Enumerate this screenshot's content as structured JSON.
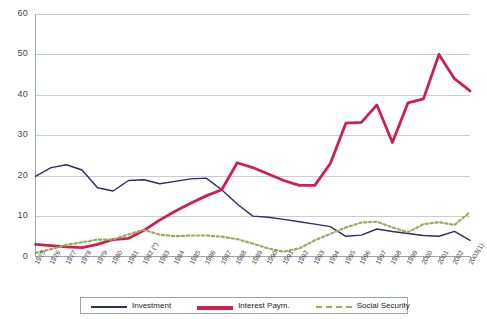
{
  "chart_data": {
    "type": "line",
    "title": "",
    "subtitle": "",
    "xlabel": "",
    "ylabel": "",
    "ylim": [
      0,
      60
    ],
    "yticks": [
      0,
      10,
      20,
      30,
      40,
      50,
      60
    ],
    "grid": true,
    "legend_position": "bottom",
    "categories": [
      "1975",
      "1976",
      "1977",
      "1978",
      "1979",
      "1980",
      "1981",
      "1982 (*)",
      "1983",
      "1984",
      "1985",
      "1986",
      "1987",
      "1988",
      "1989",
      "1990",
      "1991",
      "1992",
      "1993",
      "1994",
      "1995",
      "1996",
      "1997",
      "1998",
      "1999",
      "2000",
      "2001",
      "2002",
      "2003(1)"
    ],
    "series": [
      {
        "name": "Investment",
        "color": "#2b2f63",
        "style": "solid",
        "values": [
          19.8,
          22.0,
          22.7,
          21.4,
          17.0,
          16.2,
          18.8,
          19.0,
          18.0,
          18.6,
          19.2,
          19.4,
          16.5,
          13.0,
          10.0,
          9.7,
          9.2,
          8.6,
          8.0,
          7.4,
          5.0,
          5.3,
          6.8,
          6.2,
          5.7,
          5.2,
          5.0,
          6.2,
          4.0
        ]
      },
      {
        "name": "Interest Paym.",
        "color": "#cf1f4e",
        "style": "solid",
        "values": [
          3.0,
          2.7,
          2.4,
          2.2,
          3.0,
          4.2,
          4.5,
          6.5,
          9.0,
          11.2,
          13.2,
          15.0,
          16.5,
          23.2,
          22.0,
          20.4,
          18.8,
          17.6,
          17.6,
          23.0,
          33.0,
          33.2,
          37.5,
          28.2,
          38.0,
          39.0,
          50.0,
          44.0,
          41.0
        ]
      },
      {
        "name": "Social Security",
        "color": "#9aa860",
        "style": "dashed",
        "values": [
          0.9,
          1.8,
          2.9,
          3.5,
          4.2,
          4.2,
          5.5,
          6.6,
          5.4,
          5.0,
          5.2,
          5.2,
          4.9,
          4.3,
          3.2,
          2.0,
          1.2,
          2.0,
          4.0,
          5.6,
          7.2,
          8.4,
          8.6,
          7.2,
          6.0,
          8.0,
          8.5,
          7.8,
          11.0
        ]
      }
    ]
  },
  "legend": {
    "entries": [
      {
        "label": "Investment",
        "color": "#2b2f63",
        "style": "solid"
      },
      {
        "label": "Interest Paym.",
        "color": "#cf1f4e",
        "style": "solid"
      },
      {
        "label": "Social Security",
        "color": "#9aa860",
        "style": "dashed"
      }
    ]
  },
  "axis": {
    "y_tick_labels": [
      "0",
      "10",
      "20",
      "30",
      "40",
      "50",
      "60"
    ]
  }
}
